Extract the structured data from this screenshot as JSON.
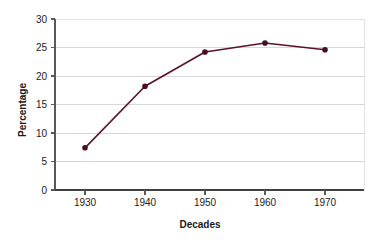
{
  "chart_data": {
    "type": "line",
    "title": "",
    "xlabel": "Decades",
    "ylabel": "Percentage",
    "categories": [
      "1930",
      "1940",
      "1950",
      "1960",
      "1970"
    ],
    "x": [
      1930,
      1940,
      1950,
      1960,
      1970
    ],
    "values": [
      7.4,
      18.2,
      24.2,
      25.8,
      24.6
    ],
    "series": [
      {
        "name": "Percentage",
        "values": [
          7.4,
          18.2,
          24.2,
          25.8,
          24.6
        ]
      }
    ],
    "ylim": [
      0,
      30
    ],
    "ytick_labels": [
      "0",
      "5",
      "10",
      "15",
      "20",
      "25",
      "30"
    ],
    "yticks": [
      0,
      5,
      10,
      15,
      20,
      25,
      30
    ],
    "xtick_labels": [
      "1930",
      "1940",
      "1950",
      "1960",
      "1970"
    ],
    "grid": "horizontal",
    "legend": "none",
    "colors": {
      "series": "#5c1030",
      "marker": "#4a0c24",
      "gridline": "#d7d7d7",
      "axis": "#58595b",
      "text": "#1a1a1a",
      "background": "#ffffff"
    }
  }
}
